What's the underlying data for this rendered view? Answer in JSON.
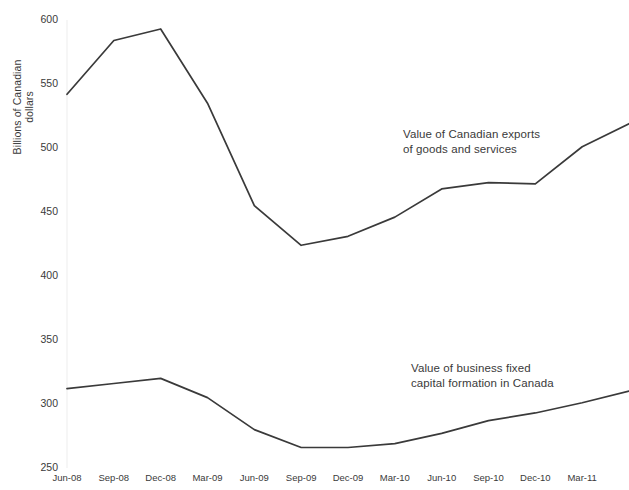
{
  "chart_data": {
    "type": "line",
    "title": "",
    "xlabel": "",
    "ylabel": "Billions of Canadian\ndollars",
    "ylim": [
      250,
      600
    ],
    "yticks": [
      250,
      300,
      350,
      400,
      450,
      500,
      550,
      600
    ],
    "grid": false,
    "legend_position": "inline-annotations",
    "categories": [
      "Jun-08",
      "Sep-08",
      "Dec-08",
      "Mar-09",
      "Jun-09",
      "Sep-09",
      "Dec-09",
      "Mar-10",
      "Jun-10",
      "Sep-10",
      "Dec-10",
      "Mar-11",
      "Jun-11"
    ],
    "tick_labels": [
      "Jun-08",
      "Sep-08",
      "Dec-08",
      "Mar-09",
      "Jun-09",
      "Sep-09",
      "Dec-09",
      "Mar-10",
      "Jun-10",
      "Sep-10",
      "Dec-10",
      "Mar-11"
    ],
    "series": [
      {
        "name": "Value of Canadian exports of goods and services",
        "color": "#3a3a3a",
        "values": [
          542,
          584,
          593,
          535,
          455,
          424,
          431,
          446,
          468,
          473,
          472,
          501,
          519
        ]
      },
      {
        "name": "Value of business fixed capital formation in Canada",
        "color": "#3a3a3a",
        "values": [
          312,
          316,
          320,
          305,
          280,
          266,
          266,
          269,
          277,
          287,
          293,
          301,
          310
        ]
      }
    ],
    "annotations": [
      {
        "id": "exports",
        "text": "Value of Canadian exports\nof goods and services"
      },
      {
        "id": "investment",
        "text": "Value of business fixed\ncapital formation in Canada"
      }
    ]
  },
  "axis": {
    "y_title": "Billions of Canadian\ndollars",
    "y_labels": [
      "600",
      "550",
      "500",
      "450",
      "400",
      "350",
      "300",
      "250"
    ],
    "x_labels": [
      "Jun-08",
      "Sep-08",
      "Dec-08",
      "Mar-09",
      "Jun-09",
      "Sep-09",
      "Dec-09",
      "Mar-10",
      "Jun-10",
      "Sep-10",
      "Dec-10",
      "Mar-11"
    ]
  }
}
